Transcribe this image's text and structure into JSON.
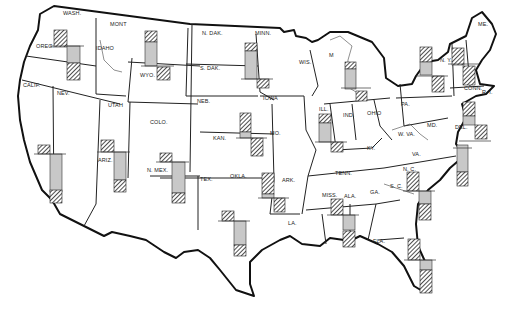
{
  "map": {
    "title": "",
    "colors": {
      "background": "#ffffff",
      "border": "#111111",
      "grey_bar": "#c8c8c8",
      "hatch_line": "#222222"
    },
    "legend": {
      "hatched": "hatched bar",
      "grey": "grey bar"
    },
    "states": [
      {
        "id": "wa",
        "label": "WASH.",
        "x": 63,
        "y": 15
      },
      {
        "id": "or",
        "label": "OREG.",
        "x": 36,
        "y": 48
      },
      {
        "id": "ca",
        "label": "CALIF.",
        "x": 23,
        "y": 87
      },
      {
        "id": "nv",
        "label": "NEV.",
        "x": 57,
        "y": 95
      },
      {
        "id": "id",
        "label": "IDAHO",
        "x": 96,
        "y": 50
      },
      {
        "id": "mt",
        "label": "MONT",
        "x": 110,
        "y": 26
      },
      {
        "id": "wy",
        "label": "WYO.",
        "x": 140,
        "y": 77
      },
      {
        "id": "ut",
        "label": "UTAH",
        "x": 108,
        "y": 107
      },
      {
        "id": "co",
        "label": "COLO.",
        "x": 150,
        "y": 124
      },
      {
        "id": "az",
        "label": "ARIZ.",
        "x": 98,
        "y": 162
      },
      {
        "id": "nm",
        "label": "N. MEX.",
        "x": 147,
        "y": 172
      },
      {
        "id": "nd",
        "label": "N. DAK.",
        "x": 202,
        "y": 35
      },
      {
        "id": "sd",
        "label": "S. DAK.",
        "x": 200,
        "y": 70
      },
      {
        "id": "mn",
        "label": "MINN.",
        "x": 255,
        "y": 35
      },
      {
        "id": "ne",
        "label": "NEB.",
        "x": 197,
        "y": 103
      },
      {
        "id": "ia",
        "label": "IOWA",
        "x": 263,
        "y": 100
      },
      {
        "id": "ks",
        "label": "KAN.",
        "x": 213,
        "y": 140
      },
      {
        "id": "mo",
        "label": "MO.",
        "x": 270,
        "y": 135
      },
      {
        "id": "ok",
        "label": "OKLA.",
        "x": 230,
        "y": 178
      },
      {
        "id": "tx",
        "label": "TEX.",
        "x": 200,
        "y": 181
      },
      {
        "id": "ar",
        "label": "ARK.",
        "x": 282,
        "y": 182
      },
      {
        "id": "la",
        "label": "LA.",
        "x": 288,
        "y": 225
      },
      {
        "id": "wi",
        "label": "WIS.",
        "x": 299,
        "y": 64
      },
      {
        "id": "mi",
        "label": "M",
        "x": 329,
        "y": 57
      },
      {
        "id": "il",
        "label": "ILL.",
        "x": 319,
        "y": 111
      },
      {
        "id": "in",
        "label": "IND.",
        "x": 343,
        "y": 117
      },
      {
        "id": "oh",
        "label": "OHIO",
        "x": 367,
        "y": 115
      },
      {
        "id": "ky",
        "label": "KY.",
        "x": 367,
        "y": 150
      },
      {
        "id": "tn",
        "label": "TENN.",
        "x": 335,
        "y": 175
      },
      {
        "id": "ms",
        "label": "MISS.",
        "x": 322,
        "y": 197
      },
      {
        "id": "al",
        "label": "ALA.",
        "x": 344,
        "y": 198
      },
      {
        "id": "ga",
        "label": "GA.",
        "x": 370,
        "y": 194
      },
      {
        "id": "fl",
        "label": "FLA.",
        "x": 373,
        "y": 243
      },
      {
        "id": "sc",
        "label": "S. C.",
        "x": 390,
        "y": 188
      },
      {
        "id": "nc",
        "label": "N. C.",
        "x": 403,
        "y": 171
      },
      {
        "id": "va",
        "label": "VA.",
        "x": 412,
        "y": 156
      },
      {
        "id": "wv",
        "label": "W. VA.",
        "x": 398,
        "y": 136
      },
      {
        "id": "md",
        "label": "MD.",
        "x": 427,
        "y": 127
      },
      {
        "id": "de",
        "label": "DEL.",
        "x": 455,
        "y": 129
      },
      {
        "id": "pa",
        "label": "PA.",
        "x": 401,
        "y": 106
      },
      {
        "id": "ny",
        "label": "N. Y.",
        "x": 440,
        "y": 62
      },
      {
        "id": "ct",
        "label": "CONN.",
        "x": 464,
        "y": 90
      },
      {
        "id": "ri",
        "label": "R. I.",
        "x": 482,
        "y": 94
      },
      {
        "id": "me",
        "label": "ME.",
        "x": 478,
        "y": 26
      }
    ],
    "bar_groups": [
      {
        "id": "bar-wa-or",
        "baseline_y": 46,
        "bars": [
          {
            "type": "hatched",
            "x": 54,
            "y": 30,
            "w": 13,
            "h": 17
          },
          {
            "type": "grey",
            "x": 67,
            "y": 46,
            "w": 13,
            "h": 17
          },
          {
            "type": "hatched",
            "x": 67,
            "y": 63,
            "w": 13,
            "h": 17
          }
        ]
      },
      {
        "id": "bar-mt-wy",
        "baseline_y": 66,
        "bars": [
          {
            "type": "hatched",
            "x": 145,
            "y": 31,
            "w": 12,
            "h": 11
          },
          {
            "type": "grey",
            "x": 145,
            "y": 42,
            "w": 12,
            "h": 24
          },
          {
            "type": "hatched",
            "x": 157,
            "y": 67,
            "w": 13,
            "h": 13
          }
        ]
      },
      {
        "id": "bar-mn-sd",
        "baseline_y": 79,
        "bars": [
          {
            "type": "hatched",
            "x": 245,
            "y": 43,
            "w": 12,
            "h": 8
          },
          {
            "type": "grey",
            "x": 245,
            "y": 51,
            "w": 12,
            "h": 28
          },
          {
            "type": "hatched",
            "x": 257,
            "y": 79,
            "w": 12,
            "h": 9
          }
        ]
      },
      {
        "id": "bar-ca",
        "baseline_y": 154,
        "bars": [
          {
            "type": "hatched",
            "x": 38,
            "y": 145,
            "w": 12,
            "h": 9
          },
          {
            "type": "grey",
            "x": 50,
            "y": 154,
            "w": 12,
            "h": 38
          },
          {
            "type": "hatched",
            "x": 50,
            "y": 190,
            "w": 12,
            "h": 13
          }
        ]
      },
      {
        "id": "bar-ut-az",
        "baseline_y": 152,
        "bars": [
          {
            "type": "hatched",
            "x": 101,
            "y": 140,
            "w": 13,
            "h": 12
          },
          {
            "type": "grey",
            "x": 114,
            "y": 152,
            "w": 12,
            "h": 28
          },
          {
            "type": "hatched",
            "x": 114,
            "y": 180,
            "w": 12,
            "h": 12
          }
        ]
      },
      {
        "id": "bar-co-nm",
        "baseline_y": 162,
        "bars": [
          {
            "type": "hatched",
            "x": 160,
            "y": 153,
            "w": 12,
            "h": 9
          },
          {
            "type": "grey",
            "x": 172,
            "y": 162,
            "w": 13,
            "h": 31
          },
          {
            "type": "hatched",
            "x": 172,
            "y": 193,
            "w": 13,
            "h": 10
          }
        ]
      },
      {
        "id": "bar-ne-ks",
        "baseline_y": 138,
        "bars": [
          {
            "type": "hatched",
            "x": 240,
            "y": 113,
            "w": 11,
            "h": 19
          },
          {
            "type": "grey",
            "x": 240,
            "y": 132,
            "w": 11,
            "h": 6
          },
          {
            "type": "hatched",
            "x": 251,
            "y": 138,
            "w": 12,
            "h": 18
          }
        ]
      },
      {
        "id": "bar-ok-ar",
        "baseline_y": 198,
        "bars": [
          {
            "type": "hatched",
            "x": 262,
            "y": 173,
            "w": 12,
            "h": 21
          },
          {
            "type": "grey",
            "x": 262,
            "y": 194,
            "w": 12,
            "h": 4
          },
          {
            "type": "hatched",
            "x": 274,
            "y": 198,
            "w": 11,
            "h": 14
          }
        ]
      },
      {
        "id": "bar-tx",
        "baseline_y": 221,
        "bars": [
          {
            "type": "hatched",
            "x": 222,
            "y": 211,
            "w": 12,
            "h": 10
          },
          {
            "type": "grey",
            "x": 234,
            "y": 221,
            "w": 12,
            "h": 24
          },
          {
            "type": "hatched",
            "x": 234,
            "y": 245,
            "w": 12,
            "h": 11
          }
        ]
      },
      {
        "id": "bar-il-in",
        "baseline_y": 142,
        "bars": [
          {
            "type": "hatched",
            "x": 319,
            "y": 114,
            "w": 12,
            "h": 9
          },
          {
            "type": "grey",
            "x": 319,
            "y": 123,
            "w": 12,
            "h": 19
          },
          {
            "type": "hatched",
            "x": 331,
            "y": 142,
            "w": 12,
            "h": 10
          }
        ]
      },
      {
        "id": "bar-mi",
        "baseline_y": 88,
        "bars": [
          {
            "type": "hatched",
            "x": 345,
            "y": 62,
            "w": 11,
            "h": 7
          },
          {
            "type": "grey",
            "x": 345,
            "y": 69,
            "w": 11,
            "h": 20
          },
          {
            "type": "hatched",
            "x": 356,
            "y": 91,
            "w": 11,
            "h": 10
          }
        ]
      },
      {
        "id": "bar-ny-w",
        "baseline_y": 76,
        "bars": [
          {
            "type": "hatched",
            "x": 420,
            "y": 47,
            "w": 12,
            "h": 15
          },
          {
            "type": "grey",
            "x": 420,
            "y": 62,
            "w": 12,
            "h": 13
          },
          {
            "type": "hatched",
            "x": 432,
            "y": 76,
            "w": 12,
            "h": 16
          }
        ]
      },
      {
        "id": "bar-vt-nh",
        "baseline_y": 64,
        "bars": [
          {
            "type": "hatched",
            "x": 452,
            "y": 48,
            "w": 12,
            "h": 17
          },
          {
            "type": "hatched",
            "x": 463,
            "y": 66,
            "w": 12,
            "h": 19
          }
        ]
      },
      {
        "id": "bar-nj-de",
        "baseline_y": 141,
        "bars": [
          {
            "type": "hatched",
            "x": 463,
            "y": 102,
            "w": 12,
            "h": 14
          },
          {
            "type": "grey",
            "x": 463,
            "y": 116,
            "w": 12,
            "h": 9
          },
          {
            "type": "hatched",
            "x": 475,
            "y": 125,
            "w": 12,
            "h": 14
          }
        ]
      },
      {
        "id": "bar-md-coast",
        "baseline_y": 148,
        "bars": [
          {
            "type": "grey",
            "x": 457,
            "y": 145,
            "w": 11,
            "h": 27
          },
          {
            "type": "hatched",
            "x": 457,
            "y": 172,
            "w": 11,
            "h": 14
          }
        ]
      },
      {
        "id": "bar-nc-sc",
        "baseline_y": 191,
        "bars": [
          {
            "type": "hatched",
            "x": 407,
            "y": 172,
            "w": 12,
            "h": 19
          },
          {
            "type": "grey",
            "x": 419,
            "y": 191,
            "w": 12,
            "h": 13
          },
          {
            "type": "hatched",
            "x": 419,
            "y": 204,
            "w": 12,
            "h": 16
          }
        ]
      },
      {
        "id": "bar-ms-al",
        "baseline_y": 215,
        "bars": [
          {
            "type": "hatched",
            "x": 331,
            "y": 199,
            "w": 12,
            "h": 16
          },
          {
            "type": "grey",
            "x": 343,
            "y": 215,
            "w": 12,
            "h": 15
          },
          {
            "type": "hatched",
            "x": 343,
            "y": 231,
            "w": 12,
            "h": 16
          }
        ]
      },
      {
        "id": "bar-fl",
        "baseline_y": 260,
        "bars": [
          {
            "type": "hatched",
            "x": 408,
            "y": 239,
            "w": 12,
            "h": 21
          },
          {
            "type": "grey",
            "x": 420,
            "y": 260,
            "w": 12,
            "h": 10
          },
          {
            "type": "hatched",
            "x": 420,
            "y": 270,
            "w": 12,
            "h": 23
          }
        ]
      }
    ]
  }
}
